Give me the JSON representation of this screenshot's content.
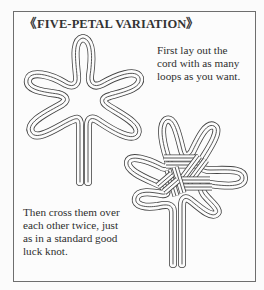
{
  "figure": {
    "title": "《FIVE-PETAL VARIATION》",
    "step1": {
      "lines": [
        "First lay out the",
        "cord with as many",
        "loops as you want."
      ]
    },
    "step2": {
      "lines": [
        "Then cross them over",
        "each other twice, just",
        "as in a standard good",
        "luck knot."
      ]
    },
    "illustrations": [
      {
        "name": "five-loop cord layout",
        "loops": 5
      },
      {
        "name": "finished five-petal knot",
        "petals": 5
      }
    ],
    "colors": {
      "ink": "#444444",
      "paper": "#fcfcfc",
      "border": "#6e6e6e"
    }
  }
}
